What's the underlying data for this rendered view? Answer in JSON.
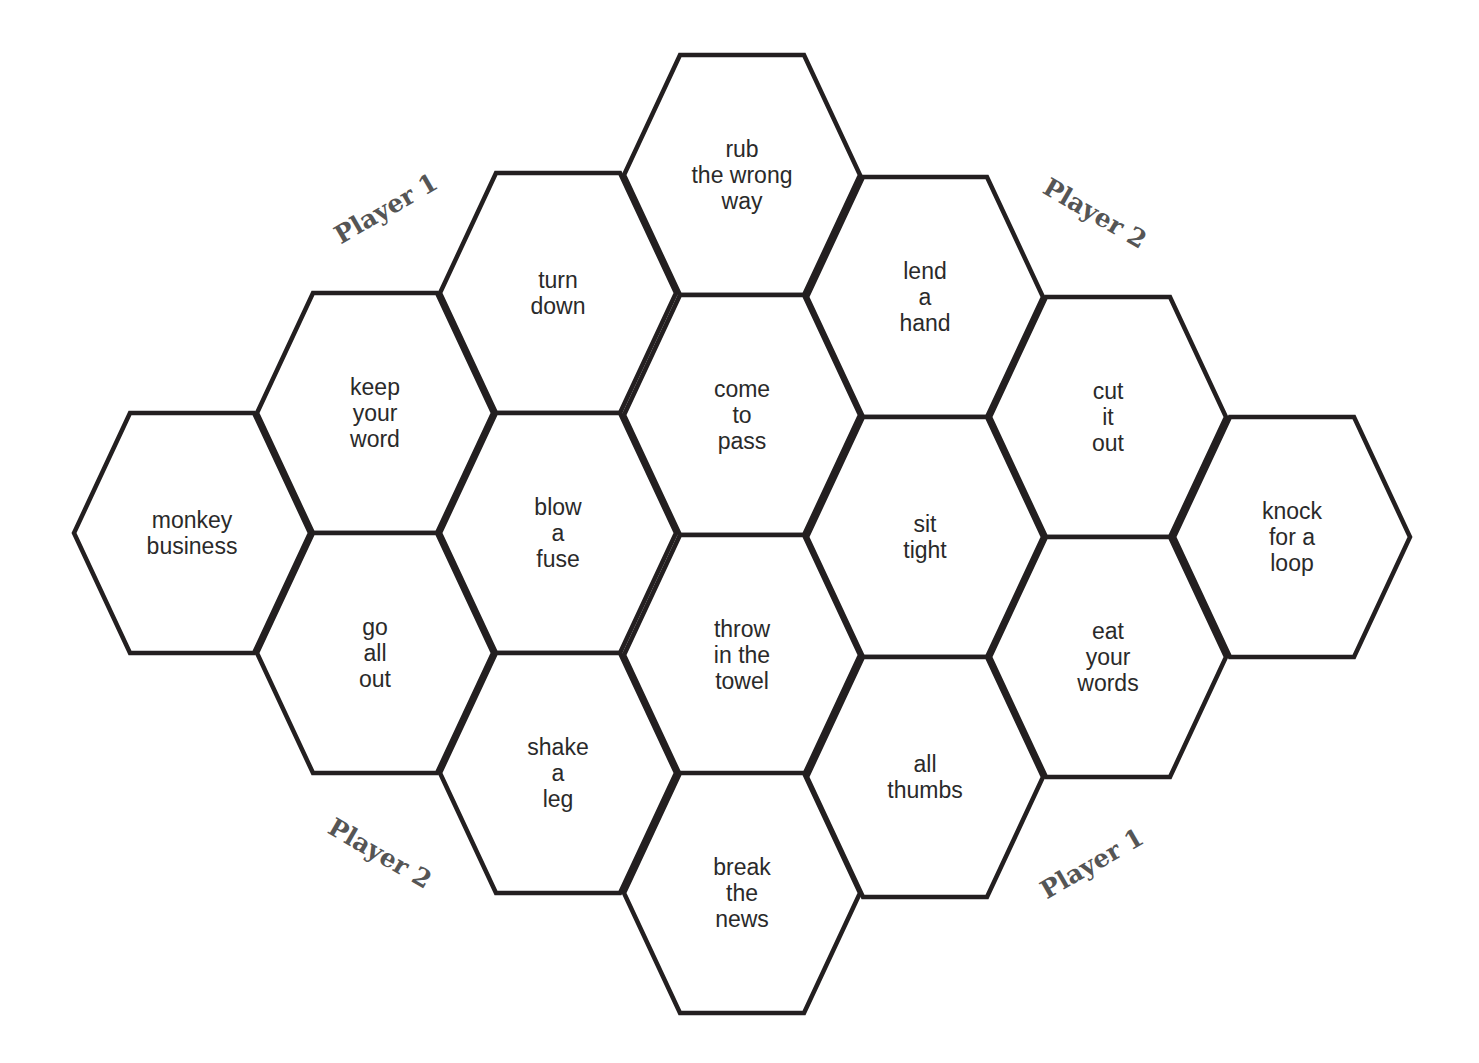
{
  "board": {
    "stroke_color": "#231f20",
    "text_color": "#2a2a2a",
    "label_color": "#555555",
    "cells": [
      {
        "col": 0,
        "cx": 192,
        "cy": 533,
        "lines": [
          "monkey",
          "business"
        ]
      },
      {
        "col": 1,
        "cx": 375,
        "cy": 413,
        "lines": [
          "keep",
          "your",
          "word"
        ]
      },
      {
        "col": 1,
        "cx": 375,
        "cy": 653,
        "lines": [
          "go",
          "all",
          "out"
        ]
      },
      {
        "col": 2,
        "cx": 558,
        "cy": 293,
        "lines": [
          "turn",
          "down"
        ]
      },
      {
        "col": 2,
        "cx": 558,
        "cy": 533,
        "lines": [
          "blow",
          "a",
          "fuse"
        ]
      },
      {
        "col": 2,
        "cx": 558,
        "cy": 773,
        "lines": [
          "shake",
          "a",
          "leg"
        ]
      },
      {
        "col": 3,
        "cx": 742,
        "cy": 175,
        "lines": [
          "rub",
          "the wrong",
          "way"
        ]
      },
      {
        "col": 3,
        "cx": 742,
        "cy": 415,
        "lines": [
          "come",
          "to",
          "pass"
        ]
      },
      {
        "col": 3,
        "cx": 742,
        "cy": 655,
        "lines": [
          "throw",
          "in the",
          "towel"
        ]
      },
      {
        "col": 3,
        "cx": 742,
        "cy": 893,
        "lines": [
          "break",
          "the",
          "news"
        ]
      },
      {
        "col": 4,
        "cx": 925,
        "cy": 297,
        "lines": [
          "lend",
          "a",
          "hand"
        ]
      },
      {
        "col": 4,
        "cx": 925,
        "cy": 537,
        "lines": [
          "sit",
          "tight"
        ]
      },
      {
        "col": 4,
        "cx": 925,
        "cy": 777,
        "lines": [
          "all",
          "thumbs"
        ]
      },
      {
        "col": 5,
        "cx": 1108,
        "cy": 417,
        "lines": [
          "cut",
          "it",
          "out"
        ]
      },
      {
        "col": 5,
        "cx": 1108,
        "cy": 657,
        "lines": [
          "eat",
          "your",
          "words"
        ]
      },
      {
        "col": 6,
        "cx": 1292,
        "cy": 537,
        "lines": [
          "knock",
          "for a",
          "loop"
        ]
      }
    ]
  },
  "labels": [
    {
      "text": "Player 1",
      "x": 386,
      "y": 210,
      "rotate": -30,
      "position": "top-left"
    },
    {
      "text": "Player 2",
      "x": 1095,
      "y": 215,
      "rotate": 30,
      "position": "top-right"
    },
    {
      "text": "Player 2",
      "x": 380,
      "y": 855,
      "rotate": 30,
      "position": "bottom-left"
    },
    {
      "text": "Player 1",
      "x": 1092,
      "y": 865,
      "rotate": -30,
      "position": "bottom-right"
    }
  ]
}
